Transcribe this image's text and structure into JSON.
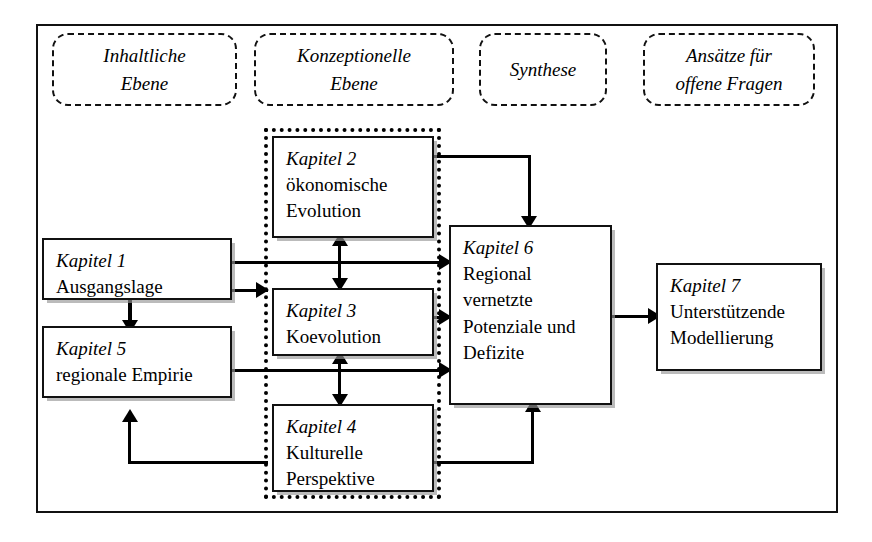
{
  "diagram": {
    "title_hidden": "",
    "columns": [
      {
        "id": "inhaltliche",
        "label_line1": "Inhaltliche",
        "label_line2": "Ebene"
      },
      {
        "id": "konzeptionelle",
        "label_line1": "Konzeptionelle",
        "label_line2": "Ebene"
      },
      {
        "id": "synthese",
        "label_line1": "Synthese",
        "label_line2": ""
      },
      {
        "id": "ansaetze",
        "label_line1": "Ansätze für",
        "label_line2": "offene Fragen"
      }
    ],
    "nodes": [
      {
        "id": "kapitel1",
        "chapter": "Kapitel 1",
        "title_line1": "Ausgangslage",
        "title_line2": "",
        "title_line3": ""
      },
      {
        "id": "kapitel5",
        "chapter": "Kapitel 5",
        "title_line1": "regionale Empirie",
        "title_line2": "",
        "title_line3": ""
      },
      {
        "id": "kapitel2",
        "chapter": "Kapitel 2",
        "title_line1": "ökonomische",
        "title_line2": "Evolution",
        "title_line3": ""
      },
      {
        "id": "kapitel3",
        "chapter": "Kapitel 3",
        "title_line1": "Koevolution",
        "title_line2": "",
        "title_line3": ""
      },
      {
        "id": "kapitel4",
        "chapter": "Kapitel 4",
        "title_line1": "Kulturelle",
        "title_line2": "Perspektive",
        "title_line3": ""
      },
      {
        "id": "kapitel6",
        "chapter": "Kapitel 6",
        "title_line1": "Regional",
        "title_line2": "vernetzte",
        "title_line3": "Potenziale und",
        "title_line4": "Defizite"
      },
      {
        "id": "kapitel7",
        "chapter": "Kapitel 7",
        "title_line1": "Unterstützende",
        "title_line2": "Modellierung",
        "title_line3": ""
      }
    ],
    "colors": {
      "stroke": "#111111",
      "background": "#ffffff",
      "shadow": "#969696"
    }
  }
}
